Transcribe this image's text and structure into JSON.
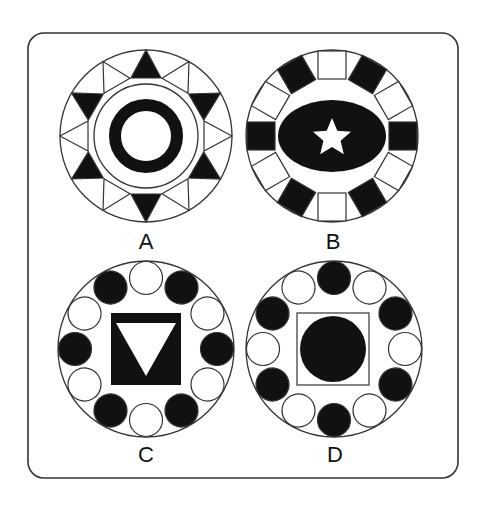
{
  "figure": {
    "frame": {
      "x": 28,
      "y": 33,
      "width": 430,
      "height": 445,
      "radius": 16,
      "stroke": "#333333"
    },
    "colors": {
      "ink": "#111111",
      "paper": "#ffffff",
      "line": "#333333"
    },
    "options": [
      {
        "label": "A",
        "center": [
          146,
          136
        ],
        "radius": 86,
        "ring_elements": "triangles",
        "count": 12,
        "pattern_start_deg": 0,
        "filled": [
          "black",
          "white",
          "black",
          "white",
          "black",
          "white",
          "black",
          "white",
          "black",
          "white",
          "black",
          "white"
        ],
        "center_shape": "thin circle containing thick black ring"
      },
      {
        "label": "B",
        "center": [
          332,
          136
        ],
        "radius": 86,
        "ring_elements": "rectangles",
        "count": 12,
        "pattern_start_deg": 0,
        "filled": [
          "white",
          "black",
          "white",
          "black",
          "white",
          "black",
          "white",
          "black",
          "white",
          "black",
          "white",
          "black"
        ],
        "center_shape": "black ellipse with white star"
      },
      {
        "label": "C",
        "center": [
          146,
          349
        ],
        "radius": 88,
        "ring_elements": "circles",
        "count": 12,
        "pattern_start_deg": 0,
        "filled": [
          "white",
          "black",
          "white",
          "black",
          "white",
          "black",
          "white",
          "black",
          "white",
          "black",
          "white",
          "black"
        ],
        "center_shape": "black square with white downward triangle"
      },
      {
        "label": "D",
        "center": [
          334,
          349
        ],
        "radius": 88,
        "ring_elements": "circles",
        "count": 12,
        "pattern_start_deg": 0,
        "filled": [
          "black",
          "white",
          "black",
          "white",
          "black",
          "white",
          "black",
          "white",
          "black",
          "white",
          "black",
          "white"
        ],
        "center_shape": "outlined square with black circle"
      }
    ]
  }
}
